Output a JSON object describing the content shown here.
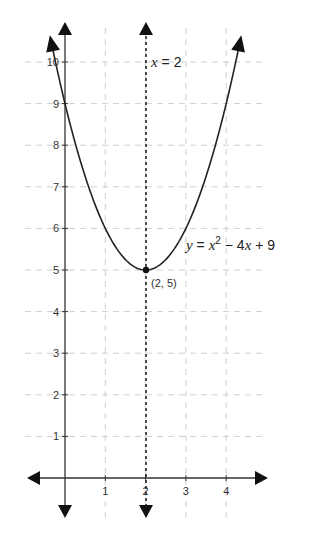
{
  "chart_data": {
    "type": "line",
    "title": "",
    "xlabel": "",
    "ylabel": "",
    "xlim": [
      -0.9,
      5.0
    ],
    "ylim": [
      -0.7,
      11.0
    ],
    "grid": true,
    "x_ticks": [
      1,
      2,
      3,
      4
    ],
    "y_ticks": [
      1,
      2,
      3,
      4,
      5,
      6,
      7,
      8,
      9,
      10
    ],
    "series": [
      {
        "name": "y = x^2 - 4x + 9",
        "style": "solid",
        "function": "x^2 - 4x + 9",
        "x": [
          -0.4,
          0,
          0.5,
          1,
          1.5,
          2,
          2.5,
          3,
          3.5,
          4,
          4.4
        ],
        "values": [
          10.76,
          9,
          7.25,
          6,
          5.25,
          5,
          5.25,
          6,
          7.25,
          9,
          10.76
        ]
      },
      {
        "name": "x = 2",
        "style": "dotted",
        "x": [
          2,
          2
        ],
        "values": [
          -0.7,
          11
        ]
      }
    ],
    "annotations": [
      {
        "text": "x = 2",
        "x": 2,
        "y": 10
      },
      {
        "text": "y = x² − 4x + 9",
        "x": 2.8,
        "y": 5.7
      },
      {
        "text": "(2, 5)",
        "x": 2,
        "y": 5,
        "type": "point"
      }
    ]
  },
  "labels": {
    "vline_var": "x",
    "vline_eq": " = 2",
    "curve_y": "y",
    "curve_eq1": " = ",
    "curve_x": "x",
    "curve_sup": "2",
    "curve_eq2": " − 4",
    "curve_x2": "x",
    "curve_eq3": " + 9",
    "vertex": "(2, 5)"
  },
  "x_tick_labels": [
    "1",
    "2",
    "3",
    "4"
  ],
  "y_tick_labels": [
    "1",
    "2",
    "3",
    "4",
    "5",
    "6",
    "7",
    "8",
    "9",
    "10"
  ],
  "colors": {
    "axis": "#333333",
    "grid": "#cccccc",
    "curve": "#222222",
    "text": "#333333"
  }
}
